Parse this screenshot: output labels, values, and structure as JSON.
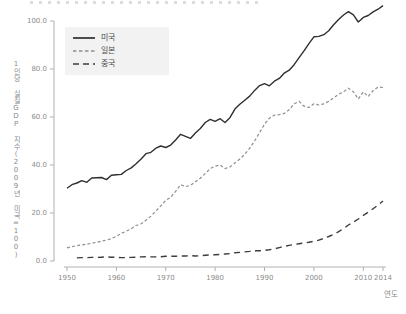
{
  "figure": {
    "note_cropped_title": "top edge shows bottom sliver of a cut-off caption"
  },
  "colors": {
    "background": "#ffffff",
    "legend_background": "#f2f2f2",
    "axis_line": "#b0b0b0",
    "tick_label": "#8c8c8c",
    "us_line": "#2f2f2f",
    "japan_line": "#8f8f8f",
    "china_line": "#3c3c3c"
  },
  "chart_data": {
    "type": "line",
    "title": "",
    "ylabel": "1인당 실질GDP 지수(2009년 미국=100)",
    "xlabel": "연도",
    "x_start_year": 1950,
    "x_end_year": 2014,
    "xlim": [
      1950,
      2014
    ],
    "ylim": [
      0,
      108
    ],
    "grid": false,
    "legend_position": "upper-left",
    "xticks": {
      "years": [
        1950,
        1960,
        1970,
        1980,
        1990,
        2000,
        2010,
        2014
      ],
      "labels": [
        "1950",
        "1960",
        "1970",
        "1980",
        "1990",
        "2000",
        "2010",
        "2014"
      ]
    },
    "yticks": {
      "values": [
        0,
        20,
        40,
        60,
        80,
        100
      ],
      "labels": [
        "0.0",
        "20.0",
        "40.0",
        "60.0",
        "80.0",
        "100.0"
      ]
    },
    "series": [
      {
        "name": "미국",
        "dash": "solid",
        "color": "#2f2f2f",
        "line_width": 1.4,
        "values": [
          30.3,
          31.8,
          32.5,
          33.5,
          32.8,
          34.6,
          34.7,
          34.8,
          33.9,
          35.7,
          35.9,
          36.1,
          37.7,
          38.8,
          40.5,
          42.5,
          44.7,
          45.3,
          47.0,
          47.9,
          47.3,
          48.3,
          50.4,
          52.8,
          51.9,
          51.1,
          53.3,
          55.2,
          57.7,
          59.0,
          58.2,
          59.3,
          57.7,
          59.7,
          63.3,
          65.3,
          67.0,
          68.7,
          71.1,
          73.1,
          73.9,
          73.0,
          74.9,
          76.1,
          78.3,
          79.5,
          81.8,
          84.7,
          87.6,
          90.6,
          93.4,
          93.6,
          94.3,
          95.9,
          98.4,
          100.6,
          102.5,
          103.9,
          102.6,
          99.6,
          101.5,
          102.3,
          103.8,
          104.9,
          106.4
        ]
      },
      {
        "name": "일본",
        "dash": "short-dash",
        "color": "#8f8f8f",
        "line_width": 1.2,
        "values": [
          5.5,
          6.0,
          6.4,
          6.7,
          7.0,
          7.4,
          7.8,
          8.3,
          8.7,
          9.3,
          10.3,
          11.5,
          12.4,
          13.4,
          14.8,
          15.5,
          17.0,
          18.7,
          20.8,
          23.0,
          25.3,
          26.6,
          29.0,
          31.8,
          31.0,
          31.5,
          33.0,
          34.5,
          36.5,
          38.5,
          39.5,
          40.0,
          38.5,
          39.2,
          40.8,
          42.5,
          44.5,
          47.0,
          50.0,
          53.5,
          57.0,
          59.5,
          60.8,
          61.0,
          61.5,
          63.0,
          65.5,
          66.5,
          64.5,
          64.0,
          65.5,
          65.0,
          65.5,
          66.5,
          68.0,
          69.5,
          70.5,
          72.0,
          70.5,
          67.5,
          70.5,
          68.5,
          71.0,
          72.5,
          72.3
        ]
      },
      {
        "name": "중국",
        "dash": "long-dash",
        "color": "#3c3c3c",
        "line_width": 1.4,
        "values": [
          null,
          null,
          1.3,
          1.4,
          1.4,
          1.5,
          1.5,
          1.6,
          1.7,
          1.6,
          1.5,
          1.4,
          1.4,
          1.5,
          1.6,
          1.7,
          1.8,
          1.7,
          1.7,
          1.8,
          2.0,
          2.0,
          2.0,
          2.1,
          2.1,
          2.2,
          2.1,
          2.2,
          2.4,
          2.5,
          2.6,
          2.7,
          2.9,
          3.1,
          3.4,
          3.6,
          3.8,
          4.0,
          4.3,
          4.3,
          4.4,
          4.7,
          5.1,
          5.6,
          6.1,
          6.5,
          6.9,
          7.2,
          7.5,
          7.8,
          8.2,
          8.7,
          9.4,
          10.2,
          11.1,
          12.2,
          13.5,
          15.0,
          16.2,
          17.5,
          19.0,
          20.3,
          21.8,
          23.3,
          25.0
        ]
      }
    ]
  }
}
